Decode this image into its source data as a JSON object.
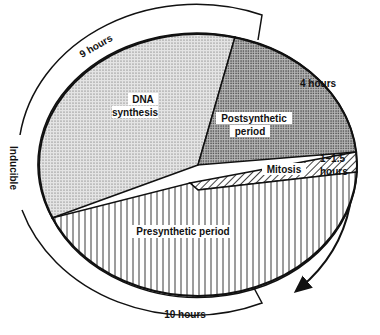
{
  "diagram": {
    "type": "cell-cycle-pie",
    "colors": {
      "line": "#111111",
      "background": "#ffffff",
      "dna_fill": "#d6d6d6",
      "post_fill": "#a8a8a8"
    },
    "segments": [
      {
        "id": "dna",
        "label_line1": "DNA",
        "label_line2": "synthesis",
        "pattern": "fine-dots"
      },
      {
        "id": "post",
        "label_line1": "Postsynthetic",
        "label_line2": "period",
        "pattern": "coarse-dots"
      },
      {
        "id": "mitosis",
        "label": "Mitosis",
        "pattern": "diagonal-hatch"
      },
      {
        "id": "pre",
        "label": "Presynthetic period",
        "pattern": "vertical-lines"
      }
    ],
    "durations": {
      "dna": "9 hours",
      "post": "4 hours",
      "mitosis_line1": "1–1.5",
      "mitosis_line2": "hours",
      "pre": "10 hours"
    },
    "outer_label": "Inducible",
    "arrow": "clockwise-direction-arrow"
  }
}
